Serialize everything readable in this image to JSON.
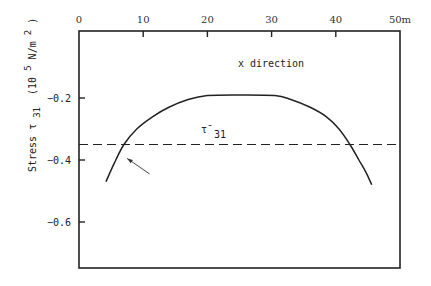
{
  "chart_data": {
    "type": "line",
    "title": "",
    "annotation": "x direction",
    "xlabel": "",
    "x_unit": "50m",
    "ylabel": "Stress τ 31 (10^5 N/m^2)",
    "ylabel_parts": {
      "main": "Stress τ",
      "sub": "31",
      "unit_open": "(10",
      "unit_exp": "5",
      "unit_mid": " N/m",
      "unit_exp2": "2",
      "unit_close": ")"
    },
    "xlim": [
      0,
      50
    ],
    "ylim": [
      -0.75,
      0.0
    ],
    "x_ticks": [
      0,
      10,
      20,
      30,
      40,
      50
    ],
    "x_tick_labels": [
      "0",
      "10",
      "20",
      "30",
      "40",
      "50m"
    ],
    "y_ticks": [
      -0.2,
      -0.4,
      -0.6
    ],
    "y_tick_labels": [
      "-0.2",
      "-0.4",
      "-0.6"
    ],
    "grid": false,
    "series": [
      {
        "name": "stress curve",
        "style": "solid",
        "x": [
          4.2,
          5.5,
          7.0,
          9.0,
          11.5,
          14.0,
          17.0,
          20.0,
          25.0,
          30.5,
          33.0,
          36.0,
          38.5,
          40.5,
          42.2,
          43.6,
          44.7,
          45.6
        ],
        "y": [
          -0.47,
          -0.41,
          -0.35,
          -0.3,
          -0.26,
          -0.23,
          -0.205,
          -0.192,
          -0.19,
          -0.192,
          -0.205,
          -0.23,
          -0.26,
          -0.3,
          -0.35,
          -0.4,
          -0.44,
          -0.48
        ]
      },
      {
        "name": "mean τ31",
        "style": "dashed",
        "x": [
          0,
          50
        ],
        "y": [
          -0.35,
          -0.35
        ]
      }
    ],
    "mean_label": {
      "symbol": "τ̄",
      "sub": "31"
    },
    "arrow": {
      "from": [
        11.0,
        -0.445
      ],
      "to": [
        7.5,
        -0.395
      ]
    }
  }
}
